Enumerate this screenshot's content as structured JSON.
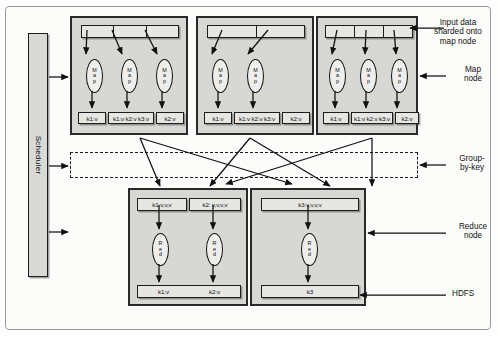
{
  "figure": {
    "scheduler_label": "Scheduler",
    "map_oval_label": [
      "M",
      "a",
      "p"
    ],
    "reduce_oval_label": [
      "R",
      "e",
      "d"
    ]
  },
  "map_nodes": [
    {
      "name": "map-node-1",
      "input_shards": 3,
      "mappers": 3,
      "outputs": [
        "k1:v",
        "k1:v k2:v k3:v",
        "k2:v"
      ]
    },
    {
      "name": "map-node-2",
      "input_shards": 2,
      "mappers": 2,
      "outputs": [
        "k1:v",
        "k1:v k2:v k3:v",
        "k2:v"
      ]
    },
    {
      "name": "map-node-3",
      "input_shards": 3,
      "mappers": 3,
      "outputs": [
        "k1:v",
        "k1:v k2:v k3:v",
        "k2:v"
      ]
    }
  ],
  "reduce_nodes": [
    {
      "name": "reduce-node-1",
      "inputs": [
        "k1:v,v,v",
        "k2: v,v,v,v"
      ],
      "reducers": 2,
      "hdfs_outputs": [
        "k1:v",
        "k2:v"
      ]
    },
    {
      "name": "reduce-node-2",
      "inputs": [
        "k3:v,v,v,v"
      ],
      "reducers": 1,
      "hdfs_outputs": [
        "k3"
      ]
    }
  ],
  "annotations": {
    "input_data": "Input data\nsharded onto\nmap node",
    "map_node": "Map\nnode",
    "group_by_key": "Group-\nby-key",
    "reduce_node": "Reduce\nnode",
    "hdfs": "HDFS"
  },
  "colors": {
    "panel_fill": "#d7d7d4",
    "box_fill": "#e6e6e3",
    "stroke": "#1d1d1d",
    "page": "#ffffff"
  }
}
